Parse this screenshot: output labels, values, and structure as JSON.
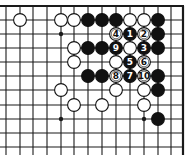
{
  "diagram": {
    "type": "go-board-fragment",
    "corner": "top-right",
    "grid": {
      "columns_x": [
        6,
        20,
        33,
        47,
        61,
        74,
        88,
        102,
        116,
        130,
        144,
        158,
        171,
        183
      ],
      "rows_y": [
        6,
        20,
        34,
        48,
        62,
        76,
        90,
        105,
        119,
        133,
        147
      ],
      "right_edge_col": 13,
      "top_edge_row": 0,
      "line_extent": {
        "x_min": 0,
        "y_max": 155
      }
    },
    "star_points": [
      {
        "col": 4,
        "row": 2
      },
      {
        "col": 4,
        "row": 8
      },
      {
        "col": 10,
        "row": 8
      }
    ],
    "stones": [
      {
        "col": 1,
        "row": 1,
        "color": "white"
      },
      {
        "col": 4,
        "row": 1,
        "color": "white"
      },
      {
        "col": 5,
        "row": 1,
        "color": "white"
      },
      {
        "col": 6,
        "row": 1,
        "color": "black"
      },
      {
        "col": 7,
        "row": 1,
        "color": "black"
      },
      {
        "col": 8,
        "row": 1,
        "color": "black"
      },
      {
        "col": 9,
        "row": 1,
        "color": "white"
      },
      {
        "col": 10,
        "row": 1,
        "color": "white"
      },
      {
        "col": 11,
        "row": 1,
        "color": "black"
      },
      {
        "col": 8,
        "row": 2,
        "color": "white",
        "label": "4"
      },
      {
        "col": 9,
        "row": 2,
        "color": "black",
        "label": "1"
      },
      {
        "col": 10,
        "row": 2,
        "color": "white",
        "label": "2"
      },
      {
        "col": 11,
        "row": 2,
        "color": "black"
      },
      {
        "col": 5,
        "row": 3,
        "color": "white"
      },
      {
        "col": 6,
        "row": 3,
        "color": "black"
      },
      {
        "col": 7,
        "row": 3,
        "color": "black"
      },
      {
        "col": 8,
        "row": 3,
        "color": "black",
        "label": "9"
      },
      {
        "col": 9,
        "row": 3,
        "color": "white"
      },
      {
        "col": 10,
        "row": 3,
        "color": "black",
        "label": "3"
      },
      {
        "col": 11,
        "row": 3,
        "color": "black"
      },
      {
        "col": 5,
        "row": 4,
        "color": "white"
      },
      {
        "col": 8,
        "row": 4,
        "color": "white"
      },
      {
        "col": 9,
        "row": 4,
        "color": "black",
        "label": "5"
      },
      {
        "col": 10,
        "row": 4,
        "color": "white",
        "label": "6"
      },
      {
        "col": 6,
        "row": 5,
        "color": "black"
      },
      {
        "col": 7,
        "row": 5,
        "color": "black"
      },
      {
        "col": 8,
        "row": 5,
        "color": "white",
        "label": "8"
      },
      {
        "col": 9,
        "row": 5,
        "color": "black",
        "label": "7"
      },
      {
        "col": 10,
        "row": 5,
        "color": "white",
        "label": "10"
      },
      {
        "col": 11,
        "row": 5,
        "color": "black"
      },
      {
        "col": 4,
        "row": 6,
        "color": "white"
      },
      {
        "col": 8,
        "row": 6,
        "color": "white"
      },
      {
        "col": 10,
        "row": 6,
        "color": "white"
      },
      {
        "col": 11,
        "row": 6,
        "color": "black"
      },
      {
        "col": 5,
        "row": 7,
        "color": "white"
      },
      {
        "col": 7,
        "row": 7,
        "color": "white"
      },
      {
        "col": 10,
        "row": 7,
        "color": "white"
      },
      {
        "col": 11,
        "row": 8,
        "color": "black"
      }
    ],
    "colors": {
      "line": "#1a1a1a",
      "black_stone": "#111111",
      "white_stone": "#ffffff",
      "stone_outline": "#111111",
      "background": "#ffffff"
    }
  }
}
